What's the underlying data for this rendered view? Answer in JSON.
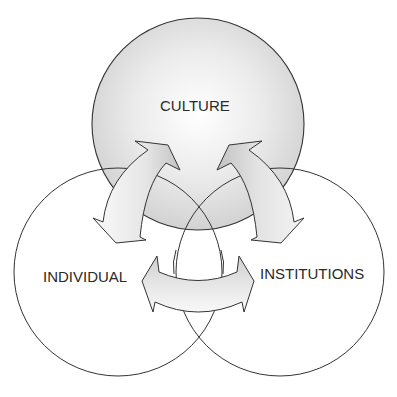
{
  "diagram": {
    "type": "venn-with-arrows",
    "circles": [
      {
        "id": "culture",
        "label": "CULTURE",
        "fill": "shaded-gray",
        "position": "top"
      },
      {
        "id": "individual",
        "label": "INDIVIDUAL",
        "fill": "white",
        "position": "bottom-left"
      },
      {
        "id": "institutions",
        "label": "INSTITUTIONS",
        "fill": "white",
        "position": "bottom-right"
      }
    ],
    "arrows": [
      {
        "between": [
          "culture",
          "individual"
        ],
        "direction": "bidirectional"
      },
      {
        "between": [
          "culture",
          "institutions"
        ],
        "direction": "bidirectional"
      },
      {
        "between": [
          "individual",
          "institutions"
        ],
        "direction": "bidirectional"
      }
    ],
    "colors": {
      "stroke": "#333333",
      "culture_fill_light": "#ffffff",
      "culture_fill_dark": "#d4d4d4",
      "arrow_fill_light": "#f7f7f7",
      "arrow_fill_dark": "#c8c8c8",
      "text": "#2a2a2a"
    }
  }
}
